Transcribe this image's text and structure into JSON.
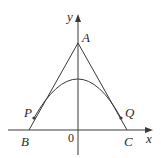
{
  "diagram": {
    "axes": {
      "x_label": "x",
      "y_label": "y",
      "origin_label": "0"
    },
    "points": {
      "A": "A",
      "B": "B",
      "C": "C",
      "P": "P",
      "Q": "Q"
    },
    "elements": [
      "triangle sides AB and AC",
      "parabola with vertex on y-axis, tangent to AB at P and AC at Q"
    ],
    "colors": {
      "stroke": "#3a3a3a",
      "background": "#ffffff"
    }
  }
}
